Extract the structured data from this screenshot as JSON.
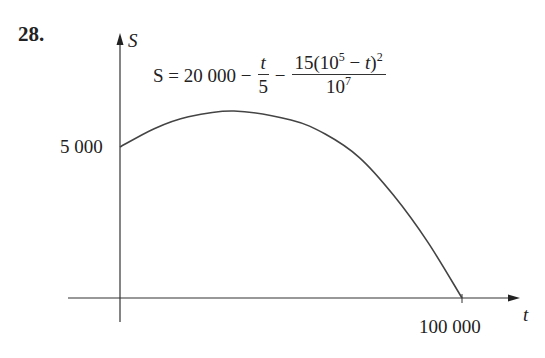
{
  "problem": {
    "number": "28."
  },
  "chart_data": {
    "type": "line",
    "title": "",
    "formula_text": "S = 20 000 − t/5 − 15(10^5 − t)^2 / 10^7",
    "formula": {
      "lhs": "S = 20 000 −",
      "frac1": {
        "num": "t",
        "den": "5"
      },
      "minus": "−",
      "frac2": {
        "num_a": "15(10",
        "num_exp": "5",
        "num_b": " − ",
        "num_var": "t",
        "num_c": ")",
        "num_exp2": "2",
        "den_base": "10",
        "den_exp": "7"
      }
    },
    "xlabel": "t",
    "ylabel": "S",
    "x_tick_labels": [
      "100 000"
    ],
    "y_tick_labels": [
      "5 000"
    ],
    "xlim": [
      0,
      100000
    ],
    "grid": false,
    "series": [
      {
        "name": "S(t)",
        "x": [
          0,
          10000,
          20000,
          33333,
          50000,
          60000,
          70000,
          80000,
          90000,
          100000
        ],
        "values": [
          5000,
          5850,
          6400,
          6667,
          6250,
          5600,
          4650,
          3400,
          1850,
          0
        ]
      }
    ]
  },
  "axes": {
    "y_label": "S",
    "x_label": "t",
    "y_tick": "5 000",
    "x_tick": "100 000"
  }
}
